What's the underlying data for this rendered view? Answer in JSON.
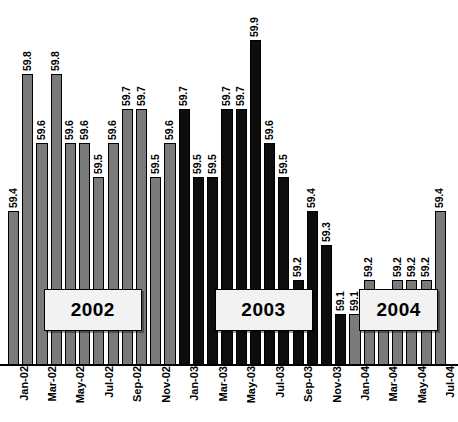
{
  "chart_data": {
    "type": "bar",
    "title": "",
    "subtitle": "",
    "xlabel": "",
    "ylabel": "",
    "grid": false,
    "legend": "none",
    "ylim": [
      58.95,
      59.95
    ],
    "value_labels": true,
    "categories": [
      "Jan-02",
      "Feb-02",
      "Mar-02",
      "Apr-02",
      "May-02",
      "Jun-02",
      "Jul-02",
      "Aug-02",
      "Sep-02",
      "Oct-02",
      "Nov-02",
      "Dec-02",
      "Jan-03",
      "Feb-03",
      "Mar-03",
      "Apr-03",
      "May-03",
      "Jun-03",
      "Jul-03",
      "Aug-03",
      "Sep-03",
      "Oct-03",
      "Nov-03",
      "Dec-03",
      "Jan-04",
      "Feb-04",
      "Mar-04",
      "Apr-04",
      "May-04",
      "Jun-04",
      "Jul-04"
    ],
    "values": [
      59.4,
      59.8,
      59.6,
      59.8,
      59.6,
      59.6,
      59.5,
      59.6,
      59.7,
      59.7,
      59.5,
      59.6,
      59.7,
      59.5,
      59.5,
      59.7,
      59.7,
      59.9,
      59.6,
      59.5,
      59.2,
      59.4,
      59.3,
      59.1,
      59.1,
      59.2,
      59.1,
      59.2,
      59.2,
      59.2,
      59.4
    ],
    "bar_colors": [
      "gray",
      "gray",
      "gray",
      "gray",
      "gray",
      "gray",
      "gray",
      "gray",
      "gray",
      "gray",
      "gray",
      "gray",
      "black",
      "black",
      "black",
      "black",
      "black",
      "black",
      "black",
      "black",
      "black",
      "black",
      "black",
      "black",
      "gray",
      "gray",
      "gray",
      "gray",
      "gray",
      "gray",
      "gray"
    ],
    "visible_tick_labels": [
      "Jan-02",
      "Mar-02",
      "May-02",
      "Jul-02",
      "Sep-02",
      "Nov-02",
      "Jan-03",
      "Mar-03",
      "May-03",
      "Jul-03",
      "Sep-03",
      "Nov-03",
      "Jan-04",
      "Mar-04",
      "May-04",
      "Jul-04"
    ],
    "series_colors": {
      "gray": "#7a7a7a",
      "black": "#0d0d0d"
    },
    "annotations": [
      {
        "label": "2002",
        "start_category": "Jan-02",
        "end_category": "Dec-02"
      },
      {
        "label": "2003",
        "start_category": "Jan-03",
        "end_category": "Dec-03"
      },
      {
        "label": "2004",
        "start_category": "Jan-04",
        "end_category": "Jul-04"
      }
    ]
  },
  "year_boxes": [
    {
      "label": "2002"
    },
    {
      "label": "2003"
    },
    {
      "label": "2004"
    }
  ]
}
